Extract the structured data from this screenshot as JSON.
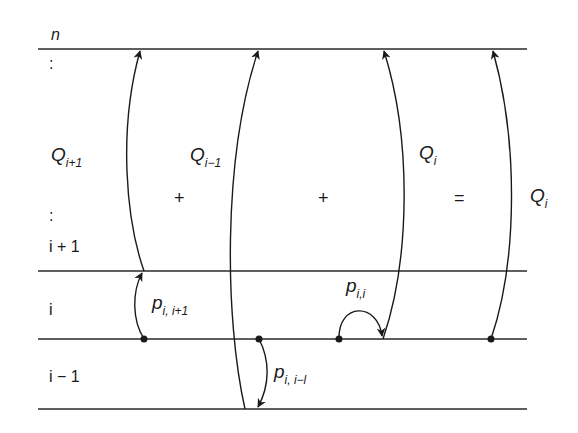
{
  "diagram": {
    "levels": {
      "top": "n",
      "upper": "i + 1",
      "middle": "i",
      "lower": "i − 1"
    },
    "vertical_ellipsis_top": ":",
    "vertical_ellipsis_mid": ":",
    "terms": [
      {
        "base": "Q",
        "sub": "i+1"
      },
      {
        "base": "Q",
        "sub": "i−1"
      },
      {
        "base": "Q",
        "sub": "i"
      },
      {
        "base": "Q",
        "sub": "i"
      }
    ],
    "operators": [
      "+",
      "+",
      "="
    ],
    "transitions": [
      {
        "base": "p",
        "sub": "i, i+1"
      },
      {
        "base": "p",
        "sub": "i,i"
      },
      {
        "base": "p",
        "sub": "i, i−l"
      }
    ],
    "colors": {
      "line": "#2a2a2a",
      "text": "#1a1a1a",
      "background": "#ffffff"
    },
    "geometry": {
      "line_y": [
        49,
        271,
        339,
        409
      ],
      "line_x": [
        38,
        527
      ]
    }
  }
}
